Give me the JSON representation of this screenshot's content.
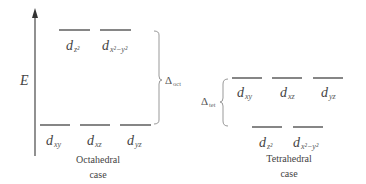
{
  "axis": {
    "label": "E"
  },
  "octahedral": {
    "caption_line1": "Octahedral",
    "caption_line2": "case",
    "delta_symbol": "Δ",
    "delta_sub": "oct",
    "upper_levels": [
      {
        "d": "d",
        "sub": "z²"
      },
      {
        "d": "d",
        "sub": "x²−y²"
      }
    ],
    "lower_levels": [
      {
        "d": "d",
        "sub": "xy"
      },
      {
        "d": "d",
        "sub": "xz"
      },
      {
        "d": "d",
        "sub": "yz"
      }
    ]
  },
  "tetrahedral": {
    "caption_line1": "Tetrahedral",
    "caption_line2": "case",
    "delta_symbol": "Δ",
    "delta_sub": "tet",
    "upper_levels": [
      {
        "d": "d",
        "sub": "xy"
      },
      {
        "d": "d",
        "sub": "xz"
      },
      {
        "d": "d",
        "sub": "yz"
      }
    ],
    "lower_levels": [
      {
        "d": "d",
        "sub": "z²"
      },
      {
        "d": "d",
        "sub": "x²−y²"
      }
    ]
  },
  "colors": {
    "line": "#444444",
    "text": "#444444",
    "bracket": "#999999"
  }
}
